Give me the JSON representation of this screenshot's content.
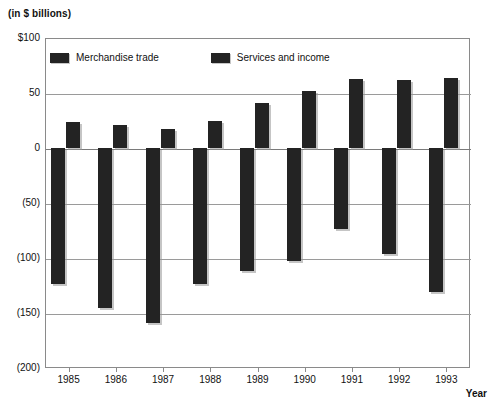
{
  "chart_data": {
    "type": "bar",
    "title": "",
    "subtitle": "",
    "unit_note": "(in $ billions)",
    "xlabel": "Year",
    "ylabel": "",
    "categories": [
      "1985",
      "1986",
      "1987",
      "1988",
      "1989",
      "1990",
      "1991",
      "1992",
      "1993"
    ],
    "series": [
      {
        "name": "Merchandise trade",
        "color": "#232323",
        "values": [
          -124,
          -145,
          -159,
          -124,
          -112,
          -103,
          -74,
          -96,
          -131
        ]
      },
      {
        "name": "Services and income",
        "color": "#232323",
        "values": [
          24,
          21,
          17,
          25,
          41,
          52,
          63,
          62,
          64
        ]
      }
    ],
    "ylim": [
      -200,
      100
    ],
    "ytick_values": [
      100,
      50,
      0,
      -50,
      -100,
      -150,
      -200
    ],
    "ytick_labels": [
      "$100",
      "50",
      "0",
      "(50)",
      "(100)",
      "(150)",
      "(200)"
    ],
    "grid": true,
    "legend_position": "top-left-inside",
    "orientation": "vertical",
    "zero_baseline": 0
  },
  "legend": {
    "items": [
      {
        "label": "Merchandise trade"
      },
      {
        "label": "Services and income"
      }
    ]
  },
  "axis": {
    "x_title": "Year"
  }
}
